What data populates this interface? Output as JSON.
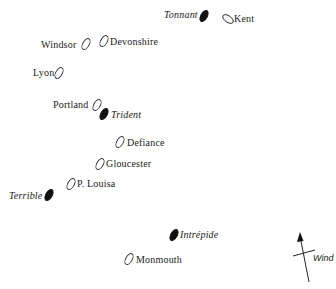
{
  "diagram": {
    "type": "naval-battle-ship-positions",
    "legend_implicit": {
      "filled_ellipse": "French ship (italic label)",
      "open_ellipse": "British ship (roman label)"
    },
    "ships": [
      {
        "name": "Tonnant",
        "side": "french",
        "x": 204,
        "y": 16,
        "label_side": "left"
      },
      {
        "name": "Kent",
        "side": "british",
        "x": 228,
        "y": 19,
        "label_side": "right"
      },
      {
        "name": "Windsor",
        "side": "british",
        "x": 86,
        "y": 44,
        "label_side": "left"
      },
      {
        "name": "Devonshire",
        "side": "british",
        "x": 104,
        "y": 41,
        "label_side": "right"
      },
      {
        "name": "Lyon",
        "side": "british",
        "x": 59,
        "y": 73,
        "label_side": "left"
      },
      {
        "name": "Portland",
        "side": "british",
        "x": 97,
        "y": 105,
        "label_side": "left"
      },
      {
        "name": "Trident",
        "side": "french",
        "x": 104,
        "y": 114,
        "label_side": "right"
      },
      {
        "name": "Defiance",
        "side": "british",
        "x": 120,
        "y": 142,
        "label_side": "right"
      },
      {
        "name": "Gloucester",
        "side": "british",
        "x": 100,
        "y": 164,
        "label_side": "right"
      },
      {
        "name": "P. Louisa",
        "side": "british",
        "x": 71,
        "y": 184,
        "label_side": "right"
      },
      {
        "name": "Terrible",
        "side": "french",
        "x": 49,
        "y": 195,
        "label_side": "left"
      },
      {
        "name": "Intrépide",
        "side": "french",
        "x": 174,
        "y": 235,
        "label_side": "right"
      },
      {
        "name": "Monmouth",
        "side": "british",
        "x": 129,
        "y": 259,
        "label_side": "right"
      }
    ],
    "wind": {
      "label": "Wind",
      "arrow_from": [
        309,
        282
      ],
      "arrow_to": [
        300,
        232
      ]
    }
  }
}
